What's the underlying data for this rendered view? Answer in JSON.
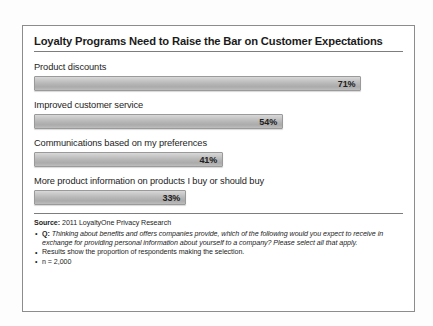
{
  "chart_data": {
    "type": "bar",
    "orientation": "horizontal",
    "title": "Loyalty Programs Need to Raise the Bar on Customer Expectations",
    "xlabel": "",
    "ylabel": "",
    "xlim": [
      0,
      80
    ],
    "grid": false,
    "legend": "none",
    "value_suffix": "%",
    "categories": [
      "Product discounts",
      "Improved customer service",
      "Communications based on my preferences",
      "More product information on products I buy or should buy"
    ],
    "values": [
      71,
      54,
      41,
      33
    ],
    "value_labels": [
      "71%",
      "54%",
      "41%",
      "33%"
    ],
    "bars": [
      {
        "label": "Product discounts",
        "value": 71,
        "value_label": "71%"
      },
      {
        "label": "Improved customer service",
        "value": 54,
        "value_label": "54%"
      },
      {
        "label": "Communications based on my preferences",
        "value": 41,
        "value_label": "41%"
      },
      {
        "label": "More product information on products I buy or should buy",
        "value": 33,
        "value_label": "33%"
      }
    ],
    "bar_color": "#b8b8b8",
    "bar_border_color": "#9a9a9a",
    "text_color": "#1d1d1d"
  },
  "footer": {
    "source_label": "Source:",
    "source_text": " 2011 LoyaltyOne Privacy Research",
    "notes": [
      {
        "q_label": "Q:",
        "text": " Thinking about benefits and offers companies provide, which of the following would you expect to receive in exchange for providing personal information about yourself to a company? Please select all that apply.",
        "italic": true
      },
      {
        "q_label": "",
        "text": "Results show the proportion of respondents making the selection.",
        "italic": false
      },
      {
        "q_label": "",
        "text": "n = 2,000",
        "italic": false
      }
    ]
  }
}
